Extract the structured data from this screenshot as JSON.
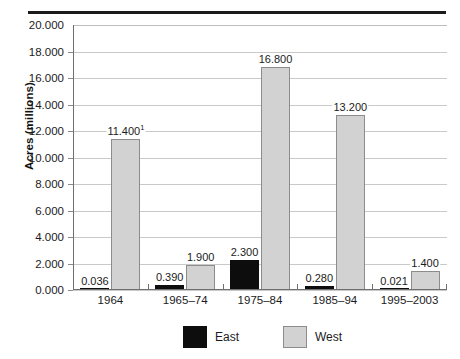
{
  "chart_data": {
    "type": "bar",
    "title": "",
    "subtitle": "",
    "xlabel": "",
    "ylabel": "Acres (millions)",
    "ylim": [
      0,
      20
    ],
    "ytick_step": 2,
    "ytick_labels": [
      "0.000",
      "2.000",
      "4.000",
      "6.000",
      "8.000",
      "10.000",
      "12.000",
      "14.000",
      "16.000",
      "18.000",
      "20.000"
    ],
    "ytick_values": [
      0,
      2,
      4,
      6,
      8,
      10,
      12,
      14,
      16,
      18,
      20
    ],
    "grid": "horizontal",
    "legend_position": "bottom",
    "categories": [
      "1964",
      "1965–74",
      "1975–84",
      "1985–94",
      "1995–2003"
    ],
    "series": [
      {
        "name": "East",
        "color": "#0d0d0d",
        "values": [
          0.036,
          0.39,
          2.3,
          0.28,
          0.021
        ],
        "labels": [
          "0.036",
          "0.390",
          "2.300",
          "0.280",
          "0.021"
        ]
      },
      {
        "name": "West",
        "color": "#d2d2d2",
        "values": [
          11.4,
          1.9,
          16.8,
          13.2,
          1.4
        ],
        "labels": [
          "11.400",
          "1.900",
          "16.800",
          "13.200",
          "1.400"
        ],
        "label_superscripts": [
          "1",
          "",
          "",
          "",
          ""
        ]
      }
    ],
    "annotations": [
      {
        "text": "superscript 1 on West 1964 value 11.400",
        "attached_to": "West/1964"
      }
    ]
  },
  "legend": {
    "items": [
      {
        "label": "East",
        "swatch": "black-square-swatch"
      },
      {
        "label": "West",
        "swatch": "gray-square-swatch"
      }
    ]
  },
  "axis": {
    "y_title": "Acres (millions)"
  }
}
